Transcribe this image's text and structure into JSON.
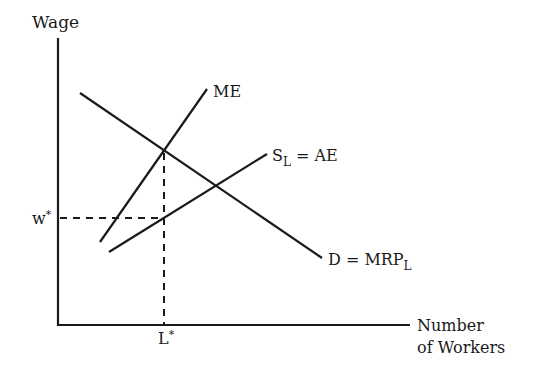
{
  "diagram": {
    "type": "monopsony labor market",
    "axes": {
      "y_label": "Wage",
      "x_label_line1": "Number",
      "x_label_line2": "of Workers",
      "origin": [
        58,
        325
      ],
      "y_top": [
        58,
        38
      ],
      "x_end": [
        410,
        325
      ]
    },
    "curves": [
      {
        "id": "ME",
        "label": "ME",
        "from": [
          100,
          242
        ],
        "to": [
          207,
          89
        ]
      },
      {
        "id": "SL",
        "label_main": "S",
        "label_sub": "L",
        "label_rest": " = AE",
        "from": [
          109,
          252
        ],
        "to": [
          267,
          154
        ]
      },
      {
        "id": "D",
        "label_main": "D = MRP",
        "label_sub": "L",
        "from": [
          80,
          93
        ],
        "to": [
          322,
          258
        ]
      }
    ],
    "equilibrium": {
      "wage_label": "w",
      "wage_sup": "*",
      "labor_label": "L",
      "labor_sup": "*",
      "wage_y": 218,
      "labor_x": 164,
      "me_d_intersection": [
        164,
        151
      ]
    },
    "colors": {
      "ink": "#1a1a1a",
      "background": "#ffffff"
    }
  }
}
